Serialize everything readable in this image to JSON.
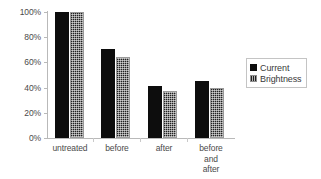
{
  "chart_data": {
    "type": "bar",
    "title": "",
    "xlabel": "",
    "ylabel": "",
    "categories": [
      "untreated",
      "before",
      "after",
      "before\nand after"
    ],
    "series": [
      {
        "name": "Current",
        "values": [
          100,
          71,
          41,
          45
        ]
      },
      {
        "name": "Brightness",
        "values": [
          100,
          64,
          37,
          40
        ]
      }
    ],
    "ylim": [
      0,
      100
    ],
    "ytick_labels": [
      "100%",
      "80%",
      "60%",
      "40%",
      "20%",
      "0%"
    ],
    "ytick_values": [
      100,
      80,
      60,
      40,
      20,
      0
    ],
    "grid": false,
    "legend_position": "right",
    "colors": {
      "current": "#0d0d0d",
      "brightness": "#5e5e5e",
      "axis": "#b9b9b9",
      "text": "#4a4a4a",
      "background": "#ffffff"
    }
  },
  "legend": {
    "items": [
      {
        "label": "Current",
        "swatch": "solid-black-square"
      },
      {
        "label": "Brightness",
        "swatch": "hatched-gray-square"
      }
    ]
  }
}
